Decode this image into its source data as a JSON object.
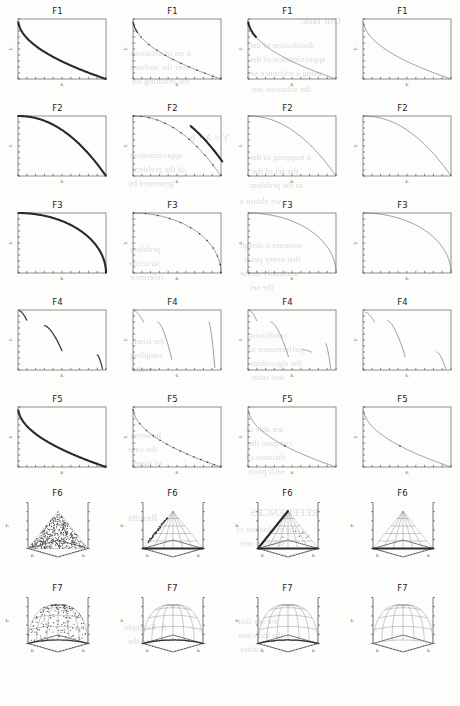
{
  "figure": {
    "layout": {
      "rows": 7,
      "columns": 4
    },
    "row_labels": [
      "F1",
      "F2",
      "F3",
      "F4",
      "F5",
      "F6",
      "F7"
    ],
    "axis_labels_2d": {
      "x": "f₁",
      "y": "f₂"
    },
    "axis_labels_3d": {
      "x": "f₁",
      "y": "f₂",
      "z": "f₃"
    }
  },
  "ghost_text": [
    {
      "text": "Our task:",
      "x": 300,
      "y": 14,
      "size": 11
    },
    {
      "text": "distribution of the",
      "x": 250,
      "y": 40,
      "size": 9
    },
    {
      "text": "approximation of the",
      "x": 250,
      "y": 54,
      "size": 9
    },
    {
      "text": "using a reference set",
      "x": 248,
      "y": 68,
      "size": 9
    },
    {
      "text": "the solutions are",
      "x": 252,
      "y": 84,
      "size": 9
    },
    {
      "text": "a set of solutions",
      "x": 130,
      "y": 48,
      "size": 9
    },
    {
      "text": "over the uniform",
      "x": 130,
      "y": 62,
      "size": 9
    },
    {
      "text": "the resulting set",
      "x": 132,
      "y": 76,
      "size": 9
    },
    {
      "text": "Y = A + b",
      "x": 190,
      "y": 132,
      "size": 10
    },
    {
      "text": "a mapping of the",
      "x": 250,
      "y": 152,
      "size": 9
    },
    {
      "text": "the set of the",
      "x": 252,
      "y": 166,
      "size": 9
    },
    {
      "text": "in the problem",
      "x": 250,
      "y": 180,
      "size": 9
    },
    {
      "text": "we obtain a",
      "x": 240,
      "y": 196,
      "size": 9
    },
    {
      "text": "approximation",
      "x": 130,
      "y": 150,
      "size": 9
    },
    {
      "text": "of the problem",
      "x": 132,
      "y": 164,
      "size": 9
    },
    {
      "text": "generated by",
      "x": 128,
      "y": 178,
      "size": 9
    },
    {
      "text": "assumes a design",
      "x": 240,
      "y": 240,
      "size": 9
    },
    {
      "text": "that every point",
      "x": 244,
      "y": 254,
      "size": 9
    },
    {
      "text": "uniformly dense",
      "x": 240,
      "y": 268,
      "size": 9
    },
    {
      "text": "the set",
      "x": 250,
      "y": 282,
      "size": 9
    },
    {
      "text": "problem",
      "x": 130,
      "y": 244,
      "size": 9
    },
    {
      "text": "structure",
      "x": 128,
      "y": 258,
      "size": 9
    },
    {
      "text": "reference",
      "x": 130,
      "y": 272,
      "size": 9
    },
    {
      "text": "conditions",
      "x": 250,
      "y": 330,
      "size": 9
    },
    {
      "text": "performance of",
      "x": 248,
      "y": 344,
      "size": 9
    },
    {
      "text": "the algorithms",
      "x": 250,
      "y": 358,
      "size": 9
    },
    {
      "text": "test suite",
      "x": 252,
      "y": 372,
      "size": 9
    },
    {
      "text": "the front",
      "x": 134,
      "y": 336,
      "size": 9
    },
    {
      "text": "sampling",
      "x": 130,
      "y": 350,
      "size": 9
    },
    {
      "text": "results",
      "x": 132,
      "y": 364,
      "size": 9
    },
    {
      "text": "are able to",
      "x": 246,
      "y": 424,
      "size": 9
    },
    {
      "text": "compute the",
      "x": 248,
      "y": 438,
      "size": 9
    },
    {
      "text": "distance of",
      "x": 246,
      "y": 452,
      "size": 9
    },
    {
      "text": "each point",
      "x": 248,
      "y": 466,
      "size": 9
    },
    {
      "text": "however",
      "x": 130,
      "y": 430,
      "size": 9
    },
    {
      "text": "the case",
      "x": 128,
      "y": 444,
      "size": 9
    },
    {
      "text": "of many",
      "x": 132,
      "y": 458,
      "size": 9
    },
    {
      "text": "REFERENCES",
      "x": 250,
      "y": 506,
      "size": 11
    },
    {
      "text": "the evaluation of",
      "x": 236,
      "y": 524,
      "size": 9
    },
    {
      "text": "solution sets",
      "x": 240,
      "y": 538,
      "size": 9
    },
    {
      "text": "Results",
      "x": 128,
      "y": 512,
      "size": 10
    },
    {
      "text": "we see that",
      "x": 238,
      "y": 616,
      "size": 9
    },
    {
      "text": "the indicator",
      "x": 238,
      "y": 630,
      "size": 9
    },
    {
      "text": "values",
      "x": 240,
      "y": 644,
      "size": 9
    },
    {
      "text": "A. Example",
      "x": 124,
      "y": 622,
      "size": 9
    },
    {
      "text": "and the",
      "x": 128,
      "y": 636,
      "size": 9
    }
  ],
  "chart_data": [
    {
      "id": "F1",
      "type": "line",
      "title": "F1",
      "xlabel": "f₁",
      "ylabel": "f₂",
      "xlim": [
        0,
        1
      ],
      "ylim": [
        0,
        1
      ],
      "shape": "convex-decreasing",
      "description": "Convex decreasing Pareto front, f2 = 1 - sqrt(f1)",
      "columns": [
        {
          "column": 1,
          "style": "dense-thick",
          "n_points": 400
        },
        {
          "column": 2,
          "style": "thin-sparse",
          "n_points": 12
        },
        {
          "column": 3,
          "style": "thin-clustered-left",
          "n_points": 60
        },
        {
          "column": 4,
          "style": "thin-uniform",
          "n_points": 40
        }
      ]
    },
    {
      "id": "F2",
      "type": "line",
      "title": "F2",
      "xlabel": "f₁",
      "ylabel": "f₂",
      "xlim": [
        0,
        1
      ],
      "ylim": [
        0,
        1
      ],
      "shape": "concave-decreasing",
      "description": "Concave decreasing Pareto front, f2 = 1 - f1^2",
      "columns": [
        {
          "column": 1,
          "style": "dense-thick",
          "n_points": 400
        },
        {
          "column": 2,
          "style": "thin-with-offset-segment",
          "n_points": 60
        },
        {
          "column": 3,
          "style": "thin-uniform",
          "n_points": 40
        },
        {
          "column": 4,
          "style": "thin-uniform",
          "n_points": 40
        }
      ]
    },
    {
      "id": "F3",
      "type": "line",
      "title": "F3",
      "xlabel": "f₁",
      "ylabel": "f₂",
      "xlim": [
        0,
        1
      ],
      "ylim": [
        0,
        1
      ],
      "shape": "quarter-circle-concave",
      "description": "Concave quarter-circle front, f1^2 + f2^2 = 1",
      "columns": [
        {
          "column": 1,
          "style": "dense-thick",
          "n_points": 400
        },
        {
          "column": 2,
          "style": "thin-uniform",
          "n_points": 50
        },
        {
          "column": 3,
          "style": "thin-uniform",
          "n_points": 40
        },
        {
          "column": 4,
          "style": "thin-uniform",
          "n_points": 40
        }
      ]
    },
    {
      "id": "F4",
      "type": "line",
      "title": "F4",
      "xlabel": "f₁",
      "ylabel": "f₂",
      "xlim": [
        0,
        1
      ],
      "ylim": [
        0,
        1
      ],
      "shape": "disconnected",
      "description": "Disconnected Pareto front with several separated segments",
      "columns": [
        {
          "column": 1,
          "style": "three-segments",
          "n_segments": 3
        },
        {
          "column": 2,
          "style": "three-segments-steep",
          "n_segments": 3
        },
        {
          "column": 3,
          "style": "four-segments",
          "n_segments": 4
        },
        {
          "column": 4,
          "style": "three-segments-sparse",
          "n_segments": 3
        }
      ]
    },
    {
      "id": "F5",
      "type": "line",
      "title": "F5",
      "xlabel": "f₁",
      "ylabel": "f₂",
      "xlim": [
        0,
        1
      ],
      "ylim": [
        0,
        1
      ],
      "shape": "convex-decreasing",
      "description": "Convex decreasing Pareto front similar to F1",
      "columns": [
        {
          "column": 1,
          "style": "dense-thick",
          "n_points": 400
        },
        {
          "column": 2,
          "style": "thin-sparse",
          "n_points": 14
        },
        {
          "column": 3,
          "style": "thin-uniform",
          "n_points": 40
        },
        {
          "column": 4,
          "style": "thin-uniform",
          "n_points": 40
        }
      ]
    },
    {
      "id": "F6",
      "type": "scatter3d",
      "title": "F6",
      "xlabel": "f₁",
      "ylabel": "f₂",
      "zlabel": "f₃",
      "xlim": [
        0,
        0.5
      ],
      "ylim": [
        0,
        0.5
      ],
      "zlim": [
        0,
        0.5
      ],
      "shape": "linear-simplex-triangle",
      "description": "Linear hyperplane front f1+f2+f3 = 0.5, rendered as a triangle",
      "columns": [
        {
          "column": 1,
          "style": "dense-scatter",
          "n_points": 500
        },
        {
          "column": 2,
          "style": "mesh-with-edge-and-arc",
          "n_points": 120
        },
        {
          "column": 3,
          "style": "mesh-with-two-edges",
          "n_points": 110
        },
        {
          "column": 4,
          "style": "mesh-with-bottom-edge",
          "n_points": 90
        }
      ]
    },
    {
      "id": "F7",
      "type": "scatter3d",
      "title": "F7",
      "xlabel": "f₁",
      "ylabel": "f₂",
      "zlabel": "f₃",
      "xlim": [
        0,
        1
      ],
      "ylim": [
        0,
        1
      ],
      "zlim": [
        0,
        1
      ],
      "shape": "spherical-octant",
      "description": "Concave spherical front f1^2+f2^2+f3^2 = 1, rendered as a dome mesh",
      "columns": [
        {
          "column": 1,
          "style": "dense-scatter-on-dome",
          "n_points": 250
        },
        {
          "column": 2,
          "style": "mesh-with-bottom-arc",
          "n_points": 120
        },
        {
          "column": 3,
          "style": "mesh-with-bottom-arc",
          "n_points": 110
        },
        {
          "column": 4,
          "style": "mesh-clean",
          "n_points": 100
        }
      ]
    }
  ]
}
